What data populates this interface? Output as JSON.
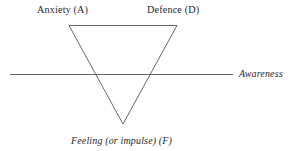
{
  "figure": {
    "kind": "triangle-of-conflict-diagram",
    "background_color": "#ffffff",
    "line_color": "#55555a",
    "text_color": "#29292b",
    "width": 299,
    "height": 151
  },
  "labels": {
    "top_left": "Anxiety (A)",
    "top_right": "Defence (D)",
    "right_axis": "Awareness",
    "bottom_apex": "Feeling (or impulse) (F)"
  },
  "geometry": {
    "triangle": {
      "top_left": {
        "x": 69,
        "y": 25.5
      },
      "top_right": {
        "x": 177,
        "y": 25.5
      },
      "apex": {
        "x": 123,
        "y": 124
      },
      "stroke_width": 0.9
    },
    "awareness_line": {
      "x1": 10,
      "y1": 74.5,
      "x2": 233,
      "y2": 74.5,
      "stroke_width": 0.9
    }
  }
}
